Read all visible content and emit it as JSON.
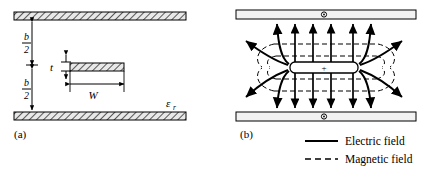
{
  "figure": {
    "type": "stripline-cross-section-and-field-diagram",
    "background_color": "#ffffff",
    "line_color": "#000000"
  },
  "panel_a": {
    "tag": "(a)",
    "description": "Stripline cross-section geometry",
    "labels": {
      "half_spacing_top_numerator": "b",
      "half_spacing_top_denominator": "2",
      "half_spacing_bottom_numerator": "b",
      "half_spacing_bottom_denominator": "2",
      "thickness": "t",
      "width": "W",
      "permittivity_symbol": "ε",
      "permittivity_subscript": "r"
    },
    "geometry": {
      "top_plate": {
        "x": 14,
        "y": 12,
        "width": 172,
        "height": 8
      },
      "bottom_plate": {
        "x": 14,
        "y": 112,
        "width": 172,
        "height": 8
      },
      "center_strip": {
        "x": 70,
        "y": 63,
        "width": 54,
        "height": 8
      },
      "hatch_fill": "diagonal"
    }
  },
  "panel_b": {
    "tag": "(b)",
    "description": "Electric and magnetic field distribution",
    "center_conductor_marker": "+",
    "plate_current_marker": "circle-dot",
    "geometry": {
      "top_plate": {
        "x": 236,
        "y": 10,
        "width": 180,
        "height": 9
      },
      "bottom_plate": {
        "x": 236,
        "y": 112,
        "width": 180,
        "height": 9
      },
      "center_strip": {
        "x": 290,
        "y": 62,
        "width": 68,
        "height": 11
      }
    },
    "field_counts": {
      "electric_arrows_above_strip": 4,
      "electric_arrows_below_strip": 4,
      "electric_fringing_curves": 8,
      "magnetic_dashed_lines_above": 2,
      "magnetic_dashed_lines_below": 2,
      "magnetic_dashed_arcs": 4
    }
  },
  "legend": {
    "items": [
      {
        "label": "Electric field",
        "style": "solid",
        "color": "#000000"
      },
      {
        "label": "Magnetic field",
        "style": "dashed",
        "color": "#000000"
      }
    ]
  }
}
